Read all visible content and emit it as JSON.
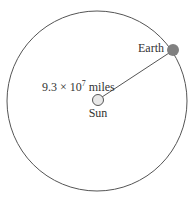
{
  "diagram": {
    "orbit": {
      "cx": 97,
      "cy": 101,
      "r": 90,
      "stroke": "#555555"
    },
    "sun": {
      "label": "Sun",
      "cx": 98,
      "cy": 100,
      "r": 5.5,
      "fill": "#e8e8e8"
    },
    "earth": {
      "label": "Earth",
      "cx": 173,
      "cy": 50,
      "r": 6,
      "fill": "#808080"
    },
    "distance": {
      "mantissa": "9.3 × 10",
      "exponent": "7",
      "unit": " miles"
    }
  }
}
